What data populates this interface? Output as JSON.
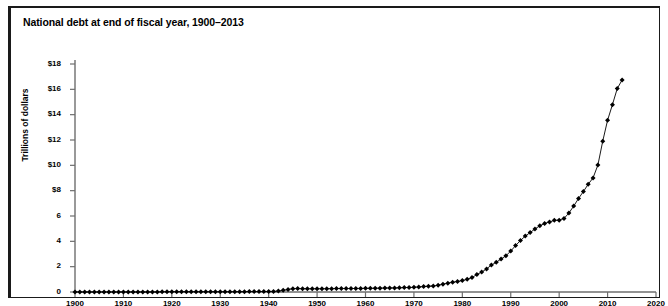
{
  "chart_title": "National debt at end of fiscal year, 1900–2013",
  "axes": {
    "y_title": "Trillions of dollars",
    "y_ticks": [
      "0",
      "2",
      "4",
      "6",
      "8",
      "$8",
      "$10",
      "$12",
      "$14",
      "$16",
      "$18"
    ],
    "x_ticks": [
      "1900",
      "1910",
      "1920",
      "1930",
      "1940",
      "1950",
      "1960",
      "1970",
      "1980",
      "1990",
      "2000",
      "2010",
      "2020"
    ]
  },
  "colors": {
    "frame": "#1a1a1a",
    "axis": "#6e6e6e",
    "series_line": "#000000",
    "marker": "#000000",
    "background": "#ffffff"
  },
  "chart_data": {
    "type": "line",
    "title": "National debt at end of fiscal year, 1900–2013",
    "xlabel": "",
    "ylabel": "Trillions of dollars",
    "xlim": [
      1900,
      2020
    ],
    "ylim": [
      0,
      18
    ],
    "grid": false,
    "legend": "none",
    "marker": "diamond",
    "y_tick_labels": [
      "0",
      "2",
      "4",
      "6",
      "8",
      "$8",
      "$10",
      "$12",
      "$14",
      "$16",
      "$18"
    ],
    "y_tick_values": [
      0,
      2,
      4,
      6,
      8,
      10,
      12,
      14,
      16,
      18
    ],
    "x_tick_values": [
      1900,
      1910,
      1920,
      1930,
      1940,
      1950,
      1960,
      1970,
      1980,
      1990,
      2000,
      2010,
      2020
    ],
    "series": [
      {
        "name": "National debt",
        "x": [
          1900,
          1901,
          1902,
          1903,
          1904,
          1905,
          1906,
          1907,
          1908,
          1909,
          1910,
          1911,
          1912,
          1913,
          1914,
          1915,
          1916,
          1917,
          1918,
          1919,
          1920,
          1921,
          1922,
          1923,
          1924,
          1925,
          1926,
          1927,
          1928,
          1929,
          1930,
          1931,
          1932,
          1933,
          1934,
          1935,
          1936,
          1937,
          1938,
          1939,
          1940,
          1941,
          1942,
          1943,
          1944,
          1945,
          1946,
          1947,
          1948,
          1949,
          1950,
          1951,
          1952,
          1953,
          1954,
          1955,
          1956,
          1957,
          1958,
          1959,
          1960,
          1961,
          1962,
          1963,
          1964,
          1965,
          1966,
          1967,
          1968,
          1969,
          1970,
          1971,
          1972,
          1973,
          1974,
          1975,
          1976,
          1977,
          1978,
          1979,
          1980,
          1981,
          1982,
          1983,
          1984,
          1985,
          1986,
          1987,
          1988,
          1989,
          1990,
          1991,
          1992,
          1993,
          1994,
          1995,
          1996,
          1997,
          1998,
          1999,
          2000,
          2001,
          2002,
          2003,
          2004,
          2005,
          2006,
          2007,
          2008,
          2009,
          2010,
          2011,
          2012,
          2013
        ],
        "values": [
          0.0021,
          0.0022,
          0.0022,
          0.0022,
          0.0023,
          0.0023,
          0.0023,
          0.0023,
          0.0023,
          0.0027,
          0.0027,
          0.0027,
          0.0027,
          0.0027,
          0.0027,
          0.0031,
          0.0033,
          0.0057,
          0.0122,
          0.0255,
          0.0243,
          0.0239,
          0.0229,
          0.0225,
          0.0211,
          0.0205,
          0.0198,
          0.0191,
          0.0177,
          0.0169,
          0.0162,
          0.0168,
          0.0192,
          0.0226,
          0.027,
          0.0286,
          0.0337,
          0.0364,
          0.0372,
          0.0402,
          0.0429,
          0.049,
          0.0721,
          0.1368,
          0.2013,
          0.2587,
          0.2694,
          0.258,
          0.2523,
          0.2527,
          0.2568,
          0.2553,
          0.2592,
          0.2661,
          0.2712,
          0.2742,
          0.2727,
          0.2726,
          0.2796,
          0.2848,
          0.2866,
          0.289,
          0.2983,
          0.3059,
          0.3122,
          0.3171,
          0.3203,
          0.3262,
          0.3479,
          0.3536,
          0.3709,
          0.3981,
          0.4272,
          0.4586,
          0.4753,
          0.5332,
          0.6202,
          0.6986,
          0.7717,
          0.8267,
          0.9079,
          0.9974,
          1.1421,
          1.3771,
          1.572,
          1.8233,
          2.1253,
          2.346,
          2.6022,
          2.8577,
          3.2331,
          3.6653,
          4.0647,
          4.4113,
          4.6927,
          4.974,
          5.2247,
          5.4132,
          5.5262,
          5.6563,
          5.6741,
          5.807,
          6.2282,
          6.7832,
          7.3793,
          7.9327,
          8.507,
          9.0079,
          10.0248,
          11.9099,
          13.5618,
          14.79,
          16.0663,
          16.7382
        ]
      }
    ]
  }
}
